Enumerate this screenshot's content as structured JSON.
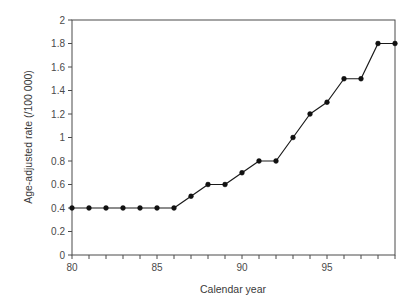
{
  "chart_data": {
    "type": "line",
    "title": "",
    "xlabel": "Calendar year",
    "ylabel": "Age-adjusted rate (/100 000)",
    "xlim": [
      80,
      99
    ],
    "ylim": [
      0,
      2
    ],
    "grid": false,
    "legend": null,
    "marker": "filled-circle",
    "line_color": "#1a1a1a",
    "marker_color": "#111111",
    "axis_color": "#4a4a4a",
    "x": [
      80,
      81,
      82,
      83,
      84,
      85,
      86,
      87,
      88,
      89,
      90,
      91,
      92,
      93,
      94,
      95,
      96,
      97,
      98,
      99
    ],
    "values": [
      0.4,
      0.4,
      0.4,
      0.4,
      0.4,
      0.4,
      0.4,
      0.5,
      0.6,
      0.6,
      0.7,
      0.8,
      0.8,
      1.0,
      1.2,
      1.3,
      1.5,
      1.5,
      1.8,
      1.8
    ],
    "xticks": [
      80,
      81,
      82,
      83,
      84,
      85,
      86,
      87,
      88,
      89,
      90,
      91,
      92,
      93,
      94,
      95,
      96,
      97,
      98,
      99
    ],
    "xtick_labels": [
      "80",
      "",
      "",
      "",
      "",
      "85",
      "",
      "",
      "",
      "",
      "90",
      "",
      "",
      "",
      "",
      "95",
      "",
      "",
      "",
      ""
    ],
    "yticks": [
      0,
      0.2,
      0.4,
      0.6,
      0.8,
      1,
      1.2,
      1.4,
      1.6,
      1.8,
      2
    ],
    "ytick_labels": [
      "0",
      "0.2",
      "0.4",
      "0.6",
      "0.8",
      "1",
      "1.2",
      "1.4",
      "1.6",
      "1.8",
      "2"
    ]
  }
}
